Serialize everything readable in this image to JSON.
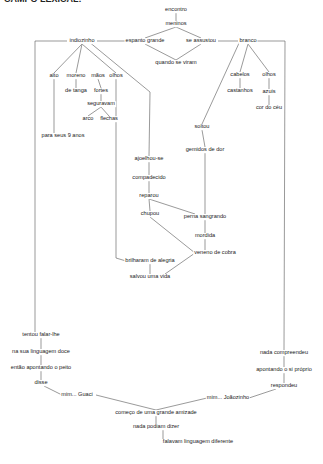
{
  "header": {
    "title": "CAMPO LEXICAL:"
  },
  "line_color": "#555555",
  "nodes": {
    "encontro": {
      "label": "encontro",
      "x": 176,
      "y": 10
    },
    "meninos": {
      "label": "meninos",
      "x": 176,
      "y": 24
    },
    "espanto": {
      "label": "espanto grande",
      "x": 145,
      "y": 41
    },
    "assustou": {
      "label": "se assustou",
      "x": 201,
      "y": 41
    },
    "viram": {
      "label": "quando se viram",
      "x": 176,
      "y": 63
    },
    "indiozinho": {
      "label": "indiozinho",
      "x": 82,
      "y": 41
    },
    "branco": {
      "label": "branco",
      "x": 248,
      "y": 41
    },
    "alto": {
      "label": "alto",
      "x": 54,
      "y": 76
    },
    "moreno": {
      "label": "moreno",
      "x": 76,
      "y": 76
    },
    "maos": {
      "label": "mãos",
      "x": 98,
      "y": 76
    },
    "olhos1": {
      "label": "olhos",
      "x": 116,
      "y": 76
    },
    "tanga": {
      "label": "de tanga",
      "x": 76,
      "y": 91
    },
    "fortes": {
      "label": "fortes",
      "x": 101,
      "y": 91
    },
    "seguravam": {
      "label": "seguravam",
      "x": 101,
      "y": 104
    },
    "arco": {
      "label": "arco",
      "x": 88,
      "y": 119
    },
    "flechas": {
      "label": "flechas",
      "x": 109,
      "y": 119
    },
    "nove": {
      "label": "para seus 9 anos",
      "x": 63,
      "y": 136
    },
    "cabelos": {
      "label": "cabelos",
      "x": 240,
      "y": 75
    },
    "olhos2": {
      "label": "olhos",
      "x": 269,
      "y": 75
    },
    "castanhos": {
      "label": "castanhos",
      "x": 240,
      "y": 91
    },
    "azuis": {
      "label": "azuis",
      "x": 269,
      "y": 92
    },
    "ceu": {
      "label": "cor do céu",
      "x": 269,
      "y": 108
    },
    "soltou": {
      "label": "soltou",
      "x": 202,
      "y": 127
    },
    "gemidos": {
      "label": "gemidos de dor",
      "x": 205,
      "y": 150
    },
    "ajoelhou": {
      "label": "ajoelhou-se",
      "x": 149,
      "y": 159
    },
    "compadecido": {
      "label": "compadecido",
      "x": 149,
      "y": 178
    },
    "reparou": {
      "label": "reparou",
      "x": 149,
      "y": 196
    },
    "chupou": {
      "label": "chupou",
      "x": 150,
      "y": 214
    },
    "perna": {
      "label": "perna sangrando",
      "x": 205,
      "y": 217
    },
    "mordida": {
      "label": "mordida",
      "x": 205,
      "y": 236
    },
    "veneno": {
      "label": "veneno de cobra",
      "x": 215,
      "y": 253
    },
    "brilharam": {
      "label": "brilharam de alegria",
      "x": 150,
      "y": 261
    },
    "salvou": {
      "label": "salvou uma vida",
      "x": 150,
      "y": 277
    },
    "tentou": {
      "label": "tentou falar-lhe",
      "x": 41,
      "y": 335
    },
    "linguagem": {
      "label": "na sua linguagem doce",
      "x": 41,
      "y": 352
    },
    "apontando1": {
      "label": "então apontando o peito",
      "x": 41,
      "y": 368
    },
    "disse": {
      "label": "disse",
      "x": 41,
      "y": 383
    },
    "guaci": {
      "label": "mim... Guaci",
      "x": 77,
      "y": 395
    },
    "compreendeu": {
      "label": "nada compreendeu",
      "x": 284,
      "y": 353
    },
    "apontando2": {
      "label": "apontando o si próprio",
      "x": 284,
      "y": 370
    },
    "respondeu": {
      "label": "respondeu",
      "x": 284,
      "y": 386
    },
    "joaozinho": {
      "label": "mim... Joãozinho",
      "x": 228,
      "y": 398
    },
    "amizade": {
      "label": "começo de uma grande amizade",
      "x": 156,
      "y": 413
    },
    "dizer": {
      "label": "nada podiam dizer",
      "x": 156,
      "y": 427
    },
    "diferente": {
      "label": "falavam linguagem diferente",
      "x": 198,
      "y": 442
    }
  },
  "edges": [
    [
      176,
      13,
      176,
      21
    ],
    [
      176,
      27,
      145,
      38
    ],
    [
      176,
      27,
      201,
      38
    ],
    [
      145,
      44,
      176,
      60
    ],
    [
      201,
      44,
      176,
      60
    ],
    [
      97,
      41,
      130,
      41
    ],
    [
      218,
      41,
      238,
      41
    ],
    [
      82,
      44,
      54,
      73
    ],
    [
      82,
      44,
      76,
      73
    ],
    [
      82,
      44,
      116,
      73
    ],
    [
      76,
      79,
      76,
      88
    ],
    [
      98,
      79,
      101,
      88
    ],
    [
      101,
      94,
      101,
      101
    ],
    [
      101,
      107,
      88,
      116
    ],
    [
      101,
      107,
      109,
      116
    ],
    [
      54,
      79,
      54,
      133
    ],
    [
      116,
      79,
      116,
      258
    ],
    [
      116,
      258,
      126,
      261
    ],
    [
      88,
      41,
      150,
      92
    ],
    [
      150,
      92,
      149,
      156
    ],
    [
      248,
      44,
      240,
      72
    ],
    [
      248,
      44,
      269,
      72
    ],
    [
      240,
      78,
      240,
      88
    ],
    [
      269,
      78,
      269,
      89
    ],
    [
      269,
      95,
      269,
      105
    ],
    [
      240,
      41,
      202,
      124
    ],
    [
      202,
      130,
      205,
      147
    ],
    [
      205,
      153,
      205,
      214
    ],
    [
      149,
      162,
      149,
      175
    ],
    [
      149,
      181,
      149,
      193
    ],
    [
      149,
      199,
      150,
      211
    ],
    [
      149,
      199,
      195,
      214
    ],
    [
      205,
      220,
      205,
      233
    ],
    [
      205,
      239,
      205,
      250
    ],
    [
      150,
      217,
      195,
      253
    ],
    [
      195,
      253,
      165,
      274
    ],
    [
      150,
      264,
      150,
      274
    ],
    [
      35,
      41,
      67,
      41
    ],
    [
      35,
      41,
      35,
      332
    ],
    [
      256,
      41,
      285,
      41
    ],
    [
      285,
      41,
      284,
      350
    ],
    [
      41,
      338,
      41,
      349
    ],
    [
      41,
      355,
      41,
      365
    ],
    [
      41,
      371,
      41,
      380
    ],
    [
      44,
      386,
      62,
      395
    ],
    [
      96,
      395,
      156,
      410
    ],
    [
      207,
      398,
      156,
      410
    ],
    [
      284,
      356,
      284,
      367
    ],
    [
      284,
      373,
      284,
      383
    ],
    [
      276,
      389,
      249,
      398
    ],
    [
      156,
      416,
      156,
      424
    ],
    [
      163,
      430,
      163,
      439
    ]
  ]
}
